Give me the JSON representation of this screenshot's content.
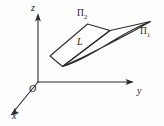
{
  "figure": {
    "background_color": "#fefefe",
    "stroke_color": "#2b2b2b",
    "width": 164,
    "height": 126,
    "axes": {
      "origin_label": "O",
      "z_label": "z",
      "y_label": "y",
      "x_label": "x",
      "origin_point": [
        38,
        82
      ],
      "z_tip": [
        38,
        14
      ],
      "y_tip": [
        133,
        82
      ],
      "x_tip": [
        11,
        114
      ]
    },
    "planes": [
      {
        "id": "pi2",
        "label": "Π",
        "subscript": "2",
        "role": "upper-parallelogram",
        "vertices": [
          [
            50,
            55
          ],
          [
            88,
            24
          ],
          [
            110,
            30
          ],
          [
            62,
            66
          ]
        ]
      },
      {
        "id": "pi1",
        "label": "Π",
        "subscript": "1",
        "role": "lower-sliver",
        "vertices": [
          [
            62,
            66
          ],
          [
            104,
            40
          ],
          [
            150,
            22
          ]
        ]
      }
    ],
    "line": {
      "label": "L",
      "description": "line of intersection of the two planes",
      "from": [
        62,
        66
      ],
      "to": [
        110,
        30
      ]
    }
  }
}
